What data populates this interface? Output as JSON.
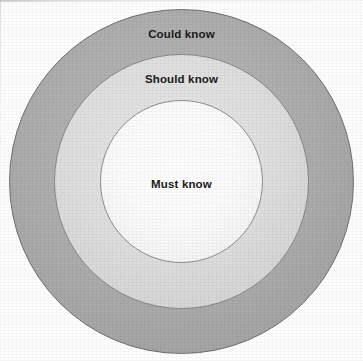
{
  "diagram": {
    "type": "concentric-circles",
    "title": "",
    "background_color": "#ffffff",
    "center": {
      "x": 181,
      "y": 181
    },
    "rings": [
      {
        "id": "could-know",
        "label": "Could know",
        "order": 3,
        "position": "outer",
        "radius": 172,
        "fill_color": "#a9a9a9",
        "stroke_color": "#6f6f6f",
        "label_color": "#1b1b1b"
      },
      {
        "id": "should-know",
        "label": "Should know",
        "order": 2,
        "position": "middle",
        "radius": 127,
        "fill_color": "#dcdcdc",
        "stroke_color": "#8a8a8a",
        "label_color": "#1b1b1b"
      },
      {
        "id": "must-know",
        "label": "Must know",
        "order": 1,
        "position": "inner",
        "radius": 81,
        "fill_color": "#fafafa",
        "stroke_color": "#8f8f8f",
        "label_color": "#1b1b1b"
      }
    ]
  }
}
